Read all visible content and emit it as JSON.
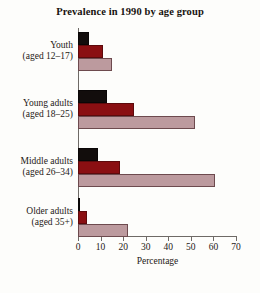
{
  "chart_data": {
    "type": "bar",
    "orientation": "horizontal",
    "title": "Prevalence in 1990 by age group",
    "xlabel": "Percentage",
    "ylabel": "",
    "xlim": [
      0,
      70
    ],
    "xticks": [
      0,
      10,
      20,
      30,
      40,
      50,
      60,
      70
    ],
    "grid": false,
    "legend": "none",
    "categories": [
      "Youth (aged 12–17)",
      "Young adults (aged 18–25)",
      "Middle adults (aged 26–34)",
      "Older adults (aged 35+)"
    ],
    "category_lines": [
      {
        "line1": "Youth",
        "line2": "(aged 12–17)"
      },
      {
        "line1": "Young adults",
        "line2": "(aged 18–25)"
      },
      {
        "line1": "Middle adults",
        "line2": "(aged 26–34)"
      },
      {
        "line1": "Older adults",
        "line2": "(aged 35+)"
      }
    ],
    "series": [
      {
        "name": "series-1",
        "color": "#120d0c",
        "values": [
          5,
          13,
          9,
          1
        ]
      },
      {
        "name": "series-2",
        "color": "#8a0f12",
        "values": [
          11,
          25,
          18.5,
          4
        ]
      },
      {
        "name": "series-3",
        "color": "#bc9a9e",
        "values": [
          15,
          52,
          60.5,
          22
        ]
      }
    ]
  },
  "colors": {
    "background": "#fdfdfb",
    "axis": "#6e6a66",
    "text": "#1d1916",
    "series_dark": "#120d0c",
    "series_red": "#8a0f12",
    "series_light": "#bc9a9e"
  }
}
